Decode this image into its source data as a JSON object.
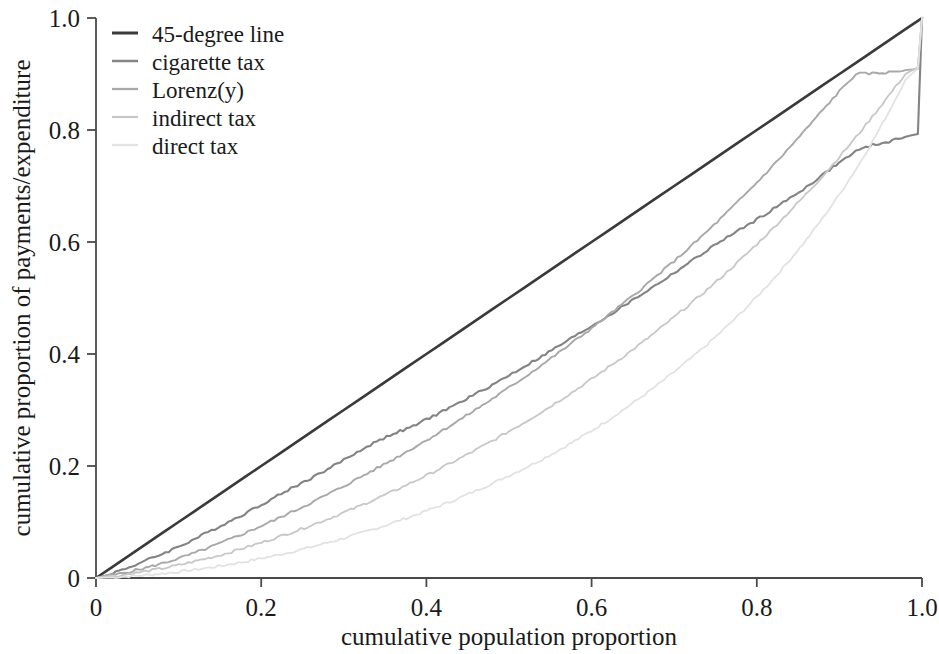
{
  "chart_data": {
    "type": "line",
    "title": "",
    "xlabel": "cumulative population proportion",
    "ylabel": "cumulative proportion of payments/expenditure",
    "xlim": [
      0,
      1
    ],
    "ylim": [
      0,
      1
    ],
    "grid": false,
    "legend_position": "top-left",
    "xticks": [
      "0",
      "0.2",
      "0.4",
      "0.6",
      "0.8",
      "1.0"
    ],
    "xtick_values": [
      0,
      0.2,
      0.4,
      0.6,
      0.8,
      1
    ],
    "yticks": [
      "0",
      "0.2",
      "0.4",
      "0.6",
      "0.8",
      "1.0"
    ],
    "ytick_values": [
      0,
      0.2,
      0.4,
      0.6,
      0.8,
      1
    ],
    "x": [
      0,
      0.02,
      0.04,
      0.06,
      0.08,
      0.1,
      0.12,
      0.14,
      0.16,
      0.18,
      0.2,
      0.22,
      0.24,
      0.26,
      0.28,
      0.3,
      0.32,
      0.34,
      0.36,
      0.38,
      0.4,
      0.42,
      0.44,
      0.46,
      0.48,
      0.5,
      0.52,
      0.54,
      0.56,
      0.58,
      0.6,
      0.62,
      0.64,
      0.66,
      0.68,
      0.7,
      0.72,
      0.74,
      0.76,
      0.78,
      0.8,
      0.82,
      0.84,
      0.86,
      0.88,
      0.9,
      0.92,
      0.94,
      0.96,
      0.98,
      0.995,
      1
    ],
    "series": [
      {
        "name": "45-degree line",
        "color": "#3a3a3a",
        "width": 2.6,
        "values": [
          0,
          0.02,
          0.04,
          0.06,
          0.08,
          0.1,
          0.12,
          0.14,
          0.16,
          0.18,
          0.2,
          0.22,
          0.24,
          0.26,
          0.28,
          0.3,
          0.32,
          0.34,
          0.36,
          0.38,
          0.4,
          0.42,
          0.44,
          0.46,
          0.48,
          0.5,
          0.52,
          0.54,
          0.56,
          0.58,
          0.6,
          0.62,
          0.64,
          0.66,
          0.68,
          0.7,
          0.72,
          0.74,
          0.76,
          0.78,
          0.8,
          0.82,
          0.84,
          0.86,
          0.88,
          0.9,
          0.92,
          0.94,
          0.96,
          0.98,
          0.995,
          1
        ]
      },
      {
        "name": "cigarette tax",
        "color": "#848484",
        "width": 2.1,
        "values": [
          0,
          0.009,
          0.019,
          0.031,
          0.043,
          0.056,
          0.07,
          0.085,
          0.1,
          0.115,
          0.131,
          0.147,
          0.163,
          0.178,
          0.194,
          0.211,
          0.228,
          0.244,
          0.258,
          0.268,
          0.283,
          0.298,
          0.313,
          0.329,
          0.345,
          0.362,
          0.379,
          0.396,
          0.414,
          0.432,
          0.45,
          0.468,
          0.487,
          0.506,
          0.525,
          0.545,
          0.565,
          0.585,
          0.605,
          0.622,
          0.64,
          0.659,
          0.678,
          0.698,
          0.72,
          0.742,
          0.762,
          0.773,
          0.779,
          0.788,
          0.793,
          1
        ]
      },
      {
        "name": "Lorenz(y)",
        "color": "#a8a8a8",
        "width": 1.9,
        "values": [
          0,
          0.005,
          0.011,
          0.018,
          0.026,
          0.035,
          0.045,
          0.056,
          0.068,
          0.08,
          0.093,
          0.106,
          0.12,
          0.134,
          0.149,
          0.164,
          0.18,
          0.196,
          0.212,
          0.229,
          0.246,
          0.264,
          0.282,
          0.301,
          0.32,
          0.34,
          0.36,
          0.381,
          0.402,
          0.424,
          0.446,
          0.469,
          0.492,
          0.516,
          0.541,
          0.566,
          0.592,
          0.619,
          0.647,
          0.676,
          0.706,
          0.737,
          0.769,
          0.802,
          0.836,
          0.869,
          0.9,
          0.901,
          0.903,
          0.907,
          0.909,
          1
        ]
      },
      {
        "name": "indirect tax",
        "color": "#c7c7c7",
        "width": 1.8,
        "values": [
          0,
          0.003,
          0.007,
          0.012,
          0.017,
          0.023,
          0.03,
          0.037,
          0.045,
          0.054,
          0.063,
          0.073,
          0.083,
          0.094,
          0.105,
          0.117,
          0.129,
          0.142,
          0.155,
          0.169,
          0.183,
          0.198,
          0.213,
          0.229,
          0.245,
          0.262,
          0.279,
          0.297,
          0.316,
          0.335,
          0.355,
          0.376,
          0.397,
          0.419,
          0.442,
          0.466,
          0.49,
          0.515,
          0.541,
          0.568,
          0.596,
          0.625,
          0.655,
          0.686,
          0.718,
          0.752,
          0.787,
          0.824,
          0.862,
          0.9,
          0.912,
          1
        ]
      },
      {
        "name": "direct tax",
        "color": "#e2e2e2",
        "width": 1.8,
        "values": [
          0,
          0.001,
          0.003,
          0.005,
          0.008,
          0.011,
          0.015,
          0.019,
          0.024,
          0.029,
          0.035,
          0.041,
          0.048,
          0.055,
          0.063,
          0.071,
          0.08,
          0.089,
          0.099,
          0.109,
          0.12,
          0.131,
          0.143,
          0.156,
          0.169,
          0.183,
          0.197,
          0.212,
          0.228,
          0.245,
          0.263,
          0.282,
          0.302,
          0.323,
          0.345,
          0.368,
          0.392,
          0.417,
          0.444,
          0.472,
          0.502,
          0.534,
          0.568,
          0.604,
          0.643,
          0.685,
          0.73,
          0.779,
          0.833,
          0.89,
          0.91,
          1
        ]
      }
    ]
  },
  "legend": {
    "entries": [
      {
        "label": "45-degree line"
      },
      {
        "label": "cigarette tax"
      },
      {
        "label": "Lorenz(y)"
      },
      {
        "label": "indirect tax"
      },
      {
        "label": "direct tax"
      }
    ]
  }
}
